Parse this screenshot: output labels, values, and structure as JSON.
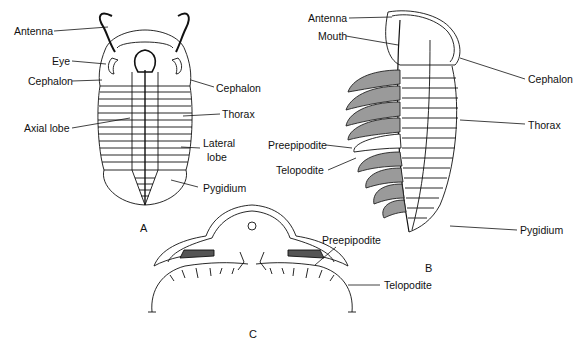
{
  "figure": {
    "panels": [
      {
        "id": "A",
        "label": "A",
        "view": "dorsal",
        "labels": [
          "Antenna",
          "Eye",
          "Cephalon",
          "Axial lobe",
          "Cephalon",
          "Thorax",
          "Lateral lobe",
          "Pygidium"
        ]
      },
      {
        "id": "B",
        "label": "B",
        "view": "ventral-dorsal split",
        "labels": [
          "Antenna",
          "Mouth",
          "Cephalon",
          "Thorax",
          "Preepipodite",
          "Telopodite",
          "Pygidium"
        ]
      },
      {
        "id": "C",
        "label": "C",
        "view": "cross-section",
        "labels": [
          "Preepipodite",
          "Telopodite"
        ]
      }
    ]
  },
  "labels": {
    "a_antenna": "Antenna",
    "a_eye": "Eye",
    "a_cephalon_left": "Cephalon",
    "a_axial_lobe": "Axial lobe",
    "a_cephalon_right": "Cephalon",
    "a_thorax": "Thorax",
    "a_lateral_lobe_1": "Lateral",
    "a_lateral_lobe_2": "lobe",
    "a_pygidium": "Pygidium",
    "b_antenna": "Antenna",
    "b_mouth": "Mouth",
    "b_cephalon": "Cephalon",
    "b_thorax": "Thorax",
    "b_preepipodite": "Preepipodite",
    "b_telopodite": "Telopodite",
    "b_pygidium": "Pygidium",
    "c_preepipodite": "Preepipodite",
    "c_telopodite": "Telopodite"
  },
  "panel_letters": {
    "a": "A",
    "b": "B",
    "c": "C"
  }
}
